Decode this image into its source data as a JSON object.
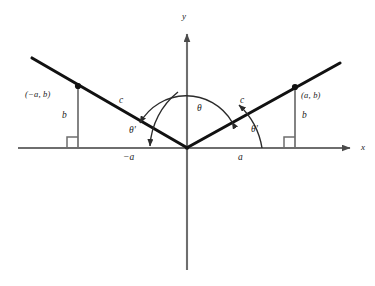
{
  "figure": {
    "colors": {
      "background": "#ffffff",
      "axis": "#6e6e6e",
      "ray": "#111111",
      "arc": "#3a3a3a",
      "drop_line": "#6e6e6e",
      "label": "#1a1a1a"
    },
    "axes": {
      "x_label": "x",
      "y_label": "y",
      "origin": {
        "x": 187,
        "y": 148
      },
      "x_axis": {
        "x1": 18,
        "x2": 355,
        "y": 148
      },
      "y_axis": {
        "x": 187,
        "y1": 30,
        "y2": 270
      }
    },
    "points": [
      {
        "name": "left-point",
        "label": "(−a, b)",
        "x": 78,
        "y": 86
      },
      {
        "name": "right-point",
        "label": "(a, b)",
        "x": 295,
        "y": 87
      }
    ],
    "rays": [
      {
        "name": "left-ray",
        "from_x": 187,
        "from_y": 148,
        "to_x": 32,
        "to_y": 58
      },
      {
        "name": "right-ray",
        "from_x": 187,
        "from_y": 148,
        "to_x": 340,
        "to_y": 63
      }
    ],
    "segment_labels": {
      "left_hypotenuse": "c",
      "right_hypotenuse": "c",
      "left_height": "b",
      "right_height": "b",
      "left_base": "−a",
      "right_base": "a"
    },
    "angle_labels": {
      "theta": "θ",
      "theta_prime_left": "θ'",
      "theta_prime_right": "θ'"
    }
  }
}
